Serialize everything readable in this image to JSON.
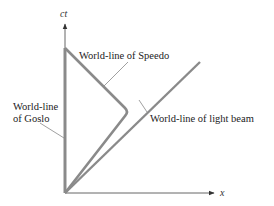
{
  "diagram": {
    "type": "spacetime-diagram",
    "axes": {
      "vertical_label": "ct",
      "horizontal_label": "x"
    },
    "labels": {
      "speedo": "World-line of Speedo",
      "goslo_line1": "World-line",
      "goslo_line2": "of Goslo",
      "light_beam": "World-line of light beam"
    },
    "colors": {
      "worldline": "#8a8a8a",
      "axis": "#555555",
      "leader": "#777777",
      "text": "#222222"
    }
  }
}
